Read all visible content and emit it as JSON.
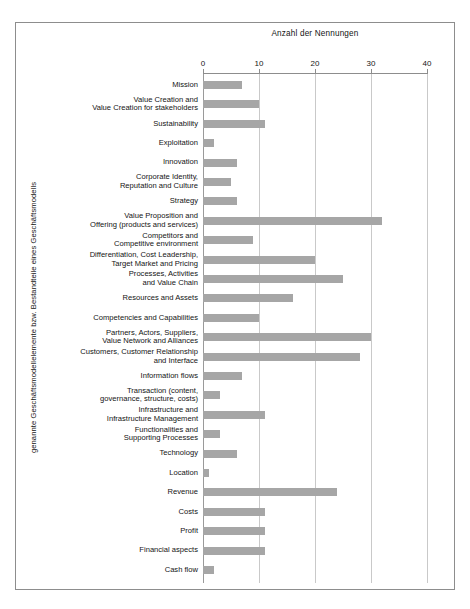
{
  "chart_data": {
    "type": "bar",
    "orientation": "horizontal",
    "title": "",
    "xlabel": "Anzahl der Nennungen",
    "ylabel": "genannte Geschäftsmodellelemente bzw. Bestandteile eines Geschäftsmodells",
    "xlim": [
      0,
      40
    ],
    "xticks": [
      0,
      10,
      20,
      30,
      40
    ],
    "grid": true,
    "legend": null,
    "bar_color": "#a6a6a6",
    "categories": [
      "Mission",
      "Value Creation and\nValue Creation for stakeholders",
      "Sustainability",
      "Exploitation",
      "Innovation",
      "Corporate Identity,\nReputation and Culture",
      "Strategy",
      "Value Proposition and\nOffering (products and services)",
      "Competitors and\nCompetitive environment",
      "Differentiation, Cost Leadership,\nTarget Market and Pricing",
      "Processes, Activities\nand Value Chain",
      "Resources and Assets",
      "Competencies and Capabilities",
      "Partners, Actors, Suppliers,\nValue Network and Alliances",
      "Customers, Customer Relationship\nand Interface",
      "Information flows",
      "Transaction (content,\ngovernance, structure, costs)",
      "Infrastructure and\nInfrastructure Management",
      "Functionalities and\nSupporting Processes",
      "Technology",
      "Location",
      "Revenue",
      "Costs",
      "Profit",
      "Financial aspects",
      "Cash flow"
    ],
    "values": [
      7,
      10,
      11,
      2,
      6,
      5,
      6,
      32,
      9,
      20,
      25,
      16,
      10,
      30,
      28,
      7,
      3,
      11,
      3,
      6,
      1,
      24,
      11,
      11,
      11,
      2
    ]
  },
  "axis": {
    "x_title": "Anzahl der Nennungen",
    "y_title": "genannte Geschäftsmodellelemente bzw. Bestandteile eines Geschäftsmodells",
    "tick_labels": [
      "0",
      "10",
      "20",
      "30",
      "40"
    ]
  }
}
